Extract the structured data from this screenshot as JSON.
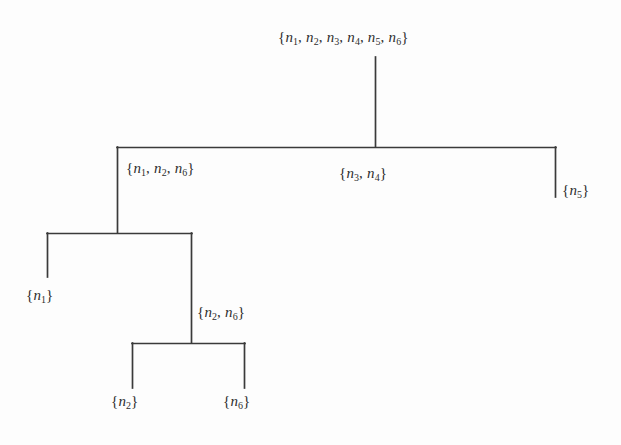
{
  "figure": {
    "type": "dendrogram",
    "title": "",
    "background_color": "#fdfdfd",
    "line_color": "#3a3a3a",
    "text_color": "#2e2e2e"
  },
  "nodes": {
    "root": {
      "label": "{n1, n2, n3, n4, n5, n6}",
      "members": [
        "n1",
        "n2",
        "n3",
        "n4",
        "n5",
        "n6"
      ],
      "level": 0
    },
    "cluster_a": {
      "label": "{n1, n2, n6}",
      "members": [
        "n1",
        "n2",
        "n6"
      ],
      "level": 1
    },
    "cluster_b": {
      "label": "{n3, n4}",
      "members": [
        "n3",
        "n4"
      ],
      "level": 1
    },
    "cluster_c": {
      "label": "{n5}",
      "members": [
        "n5"
      ],
      "level": 1
    },
    "leaf_n1": {
      "label": "{n1}",
      "members": [
        "n1"
      ],
      "level": 2
    },
    "cluster_d": {
      "label": "{n2, n6}",
      "members": [
        "n2",
        "n6"
      ],
      "level": 2
    },
    "leaf_n2": {
      "label": "{n2}",
      "members": [
        "n2"
      ],
      "level": 3
    },
    "leaf_n6": {
      "label": "{n6}",
      "members": [
        "n6"
      ],
      "level": 3
    }
  },
  "chart_data": {
    "type": "diagram",
    "title": "",
    "structure": "hierarchical cluster tree (dendrogram)",
    "levels": 4,
    "edges": [
      {
        "parent": "root",
        "child": "cluster_a"
      },
      {
        "parent": "root",
        "child": "cluster_b"
      },
      {
        "parent": "root",
        "child": "cluster_c"
      },
      {
        "parent": "cluster_a",
        "child": "leaf_n1"
      },
      {
        "parent": "cluster_a",
        "child": "cluster_d"
      },
      {
        "parent": "cluster_d",
        "child": "leaf_n2"
      },
      {
        "parent": "cluster_d",
        "child": "leaf_n6"
      }
    ]
  }
}
